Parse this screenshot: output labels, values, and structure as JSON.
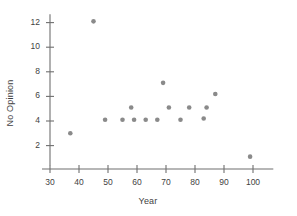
{
  "chart_data": {
    "type": "scatter",
    "title": "",
    "xlabel": "Year",
    "ylabel": "No Opinion",
    "xlim": [
      30,
      107
    ],
    "ylim": [
      0.4,
      13
    ],
    "xticks": [
      30,
      40,
      50,
      60,
      70,
      80,
      90,
      100
    ],
    "yticks": [
      2,
      4,
      6,
      8,
      10,
      12
    ],
    "grid": false,
    "legend": null,
    "marker_color": "#8a8a8a",
    "axis_color": "#6f6f6f",
    "points": [
      {
        "x": 37,
        "y": 3.0
      },
      {
        "x": 45,
        "y": 12.1
      },
      {
        "x": 49,
        "y": 4.1
      },
      {
        "x": 55,
        "y": 4.1
      },
      {
        "x": 58,
        "y": 5.1
      },
      {
        "x": 59,
        "y": 4.1
      },
      {
        "x": 63,
        "y": 4.1
      },
      {
        "x": 67,
        "y": 4.1
      },
      {
        "x": 69,
        "y": 7.1
      },
      {
        "x": 71,
        "y": 5.1
      },
      {
        "x": 75,
        "y": 4.1
      },
      {
        "x": 78,
        "y": 5.1
      },
      {
        "x": 83,
        "y": 4.2
      },
      {
        "x": 84,
        "y": 5.1
      },
      {
        "x": 87,
        "y": 6.2
      },
      {
        "x": 99,
        "y": 1.1
      }
    ],
    "xtick_labels": [
      "30",
      "40",
      "50",
      "60",
      "70",
      "80",
      "90",
      "100"
    ],
    "ytick_labels": [
      "2",
      "4",
      "6",
      "8",
      "10",
      "12"
    ]
  }
}
